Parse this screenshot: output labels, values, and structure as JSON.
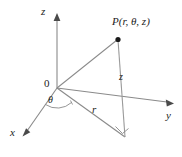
{
  "figure": {
    "background_color": "#ffffff",
    "line_color": "#8a8a8a",
    "text_color": "#1c1c1c",
    "width": 182,
    "height": 157
  },
  "labels": {
    "point": "P(r, θ, z)",
    "axis_z": "z",
    "axis_y": "y",
    "axis_x": "x",
    "origin": "0",
    "angle_theta": "θ",
    "radius_r": "r",
    "height_z": "z"
  },
  "geometry": {
    "origin": {
      "x": 57,
      "y": 88
    },
    "point_p": {
      "x": 118,
      "y": 39
    },
    "base_point": {
      "x": 125,
      "y": 137
    },
    "z_axis_tip": {
      "x": 57,
      "y": 14
    },
    "y_axis_tip": {
      "x": 173,
      "y": 103
    },
    "x_axis_tip": {
      "x": 23,
      "y": 134
    }
  },
  "icons": {
    "point_marker": "filled-dot-icon",
    "z_arrow": "arrow-up-icon",
    "y_arrow": "arrow-right-icon",
    "x_arrow": "arrow-down-left-icon",
    "right_angle_marker": "right-angle-icon",
    "angle_arc": "arc-icon"
  }
}
